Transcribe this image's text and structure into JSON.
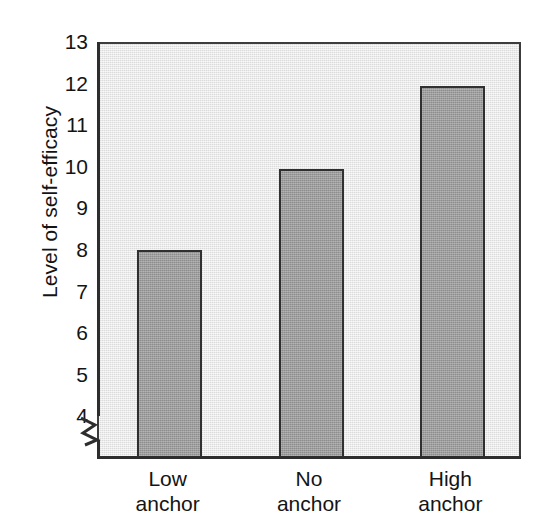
{
  "chart_data": {
    "type": "bar",
    "title": "",
    "subtitle": "",
    "xlabel": "",
    "ylabel": "Level of self-efficacy",
    "categories": [
      "Low anchor",
      "No anchor",
      "High anchor"
    ],
    "category_lines": [
      {
        "line1": "Low",
        "line2": "anchor"
      },
      {
        "line1": "No",
        "line2": "anchor"
      },
      {
        "line1": "High",
        "line2": "anchor"
      }
    ],
    "values": [
      8.05,
      10.0,
      12.0
    ],
    "ylim": [
      4,
      13
    ],
    "y_ticks": [
      4,
      5,
      6,
      7,
      8,
      9,
      10,
      11,
      12,
      13
    ],
    "y_tick_labels": [
      "4",
      "5",
      "6",
      "7",
      "8",
      "9",
      "10",
      "11",
      "12",
      "13"
    ],
    "axis_break": true,
    "axis_break_icon": "axis-break-zigzag",
    "grid": false,
    "legend": null,
    "legend_position": "none",
    "annotations": [],
    "colors": {
      "page_background": "#ffffff",
      "plot_background": "#e4e4e4",
      "bar_fill": "#9b9b9b",
      "bar_edge": "#2f2f2f",
      "axis": "#2d2d2d",
      "text": "#141414"
    }
  }
}
